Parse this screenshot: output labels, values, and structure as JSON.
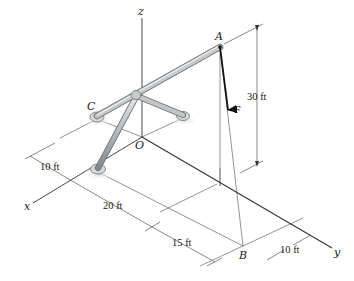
{
  "figure": {
    "type": "3D statics diagram",
    "axes": {
      "x": "x",
      "y": "y",
      "z": "z",
      "origin": "O"
    },
    "points": {
      "A": "A",
      "B": "B",
      "C": "C"
    },
    "force": {
      "label": "F"
    },
    "dimensions": {
      "height": "30 ft",
      "x_offset_top": "10 ft",
      "x_span": "20 ft",
      "y_span": "15 ft",
      "y_offset_right": "10 ft"
    },
    "colors": {
      "rod": "#b9bcbe",
      "rod_edge": "#6e7275",
      "line": "#555555",
      "axis": "#3a3a3a",
      "force": "#111111"
    }
  }
}
